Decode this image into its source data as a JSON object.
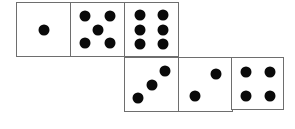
{
  "figure": {
    "name": "dice-net",
    "width": 295,
    "height": 129,
    "background_color": "#ffffff",
    "face_border_color": "#6e6e6e",
    "pip_color": "#0a0a0a",
    "face_size": 55,
    "pip_diameter": 11
  },
  "faces": [
    {
      "id": "face-1",
      "value": 1,
      "row": "top",
      "index": 0,
      "x": 16,
      "y": 2,
      "size": 55,
      "pips": [
        {
          "cx": 50,
          "cy": 50
        }
      ]
    },
    {
      "id": "face-5",
      "value": 5,
      "row": "top",
      "index": 1,
      "x": 70,
      "y": 2,
      "size": 55,
      "pips": [
        {
          "cx": 26,
          "cy": 24
        },
        {
          "cx": 74,
          "cy": 24
        },
        {
          "cx": 50,
          "cy": 50
        },
        {
          "cx": 26,
          "cy": 76
        },
        {
          "cx": 74,
          "cy": 76
        }
      ]
    },
    {
      "id": "face-6",
      "value": 6,
      "row": "top",
      "index": 2,
      "x": 124,
      "y": 2,
      "size": 55,
      "pips": [
        {
          "cx": 28,
          "cy": 22
        },
        {
          "cx": 72,
          "cy": 22
        },
        {
          "cx": 28,
          "cy": 50
        },
        {
          "cx": 72,
          "cy": 50
        },
        {
          "cx": 28,
          "cy": 78
        },
        {
          "cx": 72,
          "cy": 78
        }
      ]
    },
    {
      "id": "face-3",
      "value": 3,
      "row": "bottom",
      "index": 0,
      "x": 124,
      "y": 57,
      "size": 55,
      "pips": [
        {
          "cx": 24,
          "cy": 76
        },
        {
          "cx": 50,
          "cy": 50
        },
        {
          "cx": 76,
          "cy": 24
        }
      ]
    },
    {
      "id": "face-2",
      "value": 2,
      "row": "bottom",
      "index": 1,
      "x": 178,
      "y": 57,
      "size": 55,
      "pips": [
        {
          "cx": 30,
          "cy": 72
        },
        {
          "cx": 70,
          "cy": 30
        }
      ]
    },
    {
      "id": "face-4",
      "value": 4,
      "row": "bottom",
      "index": 2,
      "x": 231,
      "y": 57,
      "size": 53,
      "pips": [
        {
          "cx": 28,
          "cy": 28
        },
        {
          "cx": 74,
          "cy": 28
        },
        {
          "cx": 28,
          "cy": 74
        },
        {
          "cx": 74,
          "cy": 74
        }
      ]
    }
  ]
}
